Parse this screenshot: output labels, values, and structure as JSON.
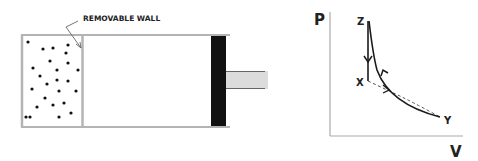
{
  "cylinder": {
    "wall_label": "REMOVABLE WALL",
    "particle_count": 25,
    "wall_color": "#b4b4b4",
    "piston_color": "#111111",
    "rod_color": "#dcdcdc",
    "particle_color": "#111111"
  },
  "pv_diagram": {
    "y_axis_label": "P",
    "x_axis_label": "V",
    "points": {
      "z": "Z",
      "x": "X",
      "y": "Y"
    },
    "line_color": "#1a1a1a",
    "axis_color": "#aaaaaa"
  }
}
